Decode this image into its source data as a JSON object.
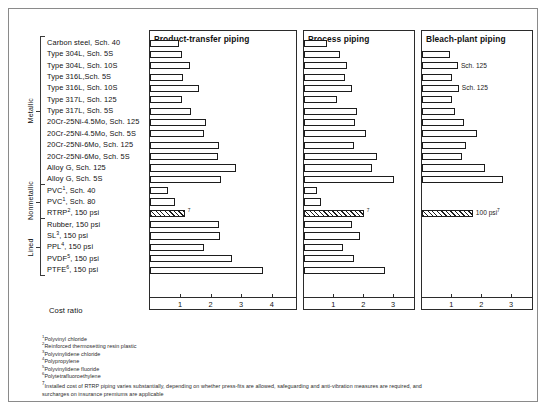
{
  "figure": {
    "cost_ratio_label": "Cost ratio"
  },
  "groups": [
    {
      "label": "Metallic",
      "start": 0,
      "count": 13
    },
    {
      "label": "Nonmetallic",
      "start": 13,
      "count": 3
    },
    {
      "label": "Lined",
      "start": 16,
      "count": 5
    }
  ],
  "rows": [
    {
      "label": "Carbon steel, Sch. 40",
      "sup": ""
    },
    {
      "label": "Type 304L, Sch. 5S",
      "sup": ""
    },
    {
      "label": "Type 304L, Sch. 10S",
      "sup": ""
    },
    {
      "label": "Type 316L,Sch. 5S",
      "sup": ""
    },
    {
      "label": "Type 316L, Sch. 10S",
      "sup": ""
    },
    {
      "label": "Type 317L, Sch. 125",
      "sup": ""
    },
    {
      "label": "Type 317L, Sch. 5S",
      "sup": ""
    },
    {
      "label": "20Cr-25Ni-4.5Mo, Sch. 125",
      "sup": ""
    },
    {
      "label": "20Cr-25Ni-4.5Mo, Sch. 5S",
      "sup": ""
    },
    {
      "label": "20Cr-25Ni-6Mo, Sch. 125",
      "sup": ""
    },
    {
      "label": "20Cr-25Ni-6Mo, Sch. 5S",
      "sup": ""
    },
    {
      "label": "Alloy G, Sch. 125",
      "sup": ""
    },
    {
      "label": "Alloy G, Sch. 5S",
      "sup": ""
    },
    {
      "label": "PVC",
      "sup": "1",
      "suffix": ", Sch. 40"
    },
    {
      "label": "PVC",
      "sup": "1",
      "suffix": ", Sch. 80"
    },
    {
      "label": "RTRP",
      "sup": "2",
      "suffix": ", 150 psi"
    },
    {
      "label": "Rubber, 150 psi",
      "sup": ""
    },
    {
      "label": "SL",
      "sup": "3",
      "suffix": ", 150 psi"
    },
    {
      "label": "PPL",
      "sup": "4",
      "suffix": ", 150 psi"
    },
    {
      "label": "PVDF",
      "sup": "5",
      "suffix": ", 150 psi"
    },
    {
      "label": "PTFE",
      "sup": "6",
      "suffix": ", 150 psi"
    }
  ],
  "chart_data": {
    "type": "bar",
    "xlabel": "Cost ratio",
    "ylabel": "",
    "orientation": "horizontal",
    "grid": false,
    "categories": [
      "Carbon steel, Sch. 40",
      "Type 304L, Sch. 5S",
      "Type 304L, Sch. 10S",
      "Type 316L,Sch. 5S",
      "Type 316L, Sch. 10S",
      "Type 317L, Sch. 125",
      "Type 317L, Sch. 5S",
      "20Cr-25Ni-4.5Mo, Sch. 125",
      "20Cr-25Ni-4.5Mo, Sch. 5S",
      "20Cr-25Ni-6Mo, Sch. 125",
      "20Cr-25Ni-6Mo, Sch. 5S",
      "Alloy G, Sch. 125",
      "Alloy G, Sch. 5S",
      "PVC, Sch. 40",
      "PVC, Sch. 80",
      "RTRP, 150 psi",
      "Rubber, 150 psi",
      "SL, 150 psi",
      "PPL, 150 psi",
      "PVDF, 150 psi",
      "PTFE, 150 psi"
    ],
    "panels": [
      {
        "name": "Product-transfer piping",
        "xlim": [
          0,
          4.45
        ],
        "ticks": [
          1,
          2,
          3,
          4
        ],
        "values": [
          0.98,
          1.05,
          1.32,
          1.08,
          1.62,
          1.05,
          1.35,
          1.85,
          1.78,
          2.28,
          2.25,
          2.82,
          2.35,
          0.62,
          0.82,
          1.15,
          2.28,
          2.3,
          1.78,
          2.7,
          3.72
        ],
        "hatched": [
          15
        ],
        "notes": [
          {
            "row": 15,
            "text": "",
            "sup": "7"
          }
        ]
      },
      {
        "name": "Process piping",
        "xlim": [
          0,
          3.35
        ],
        "ticks": [
          1,
          2,
          3
        ],
        "values": [
          0.8,
          1.22,
          1.45,
          1.38,
          1.62,
          1.12,
          1.78,
          1.72,
          2.08,
          1.68,
          2.45,
          2.3,
          3.02,
          0.45,
          0.6,
          2.02,
          1.62,
          1.88,
          1.32,
          1.7,
          2.72
        ],
        "hatched": [
          15
        ],
        "notes": [
          {
            "row": 15,
            "text": "",
            "sup": "7"
          }
        ]
      },
      {
        "name": "Bleach-plant piping",
        "xlim": [
          0,
          3.35
        ],
        "ticks": [
          1,
          2,
          3
        ],
        "values": [
          null,
          0.95,
          1.22,
          1.02,
          1.25,
          1.02,
          1.12,
          1.42,
          1.85,
          1.5,
          1.35,
          2.12,
          2.72,
          null,
          null,
          1.72,
          null,
          null,
          null,
          null,
          null
        ],
        "hatched": [
          15
        ],
        "notes": [
          {
            "row": 2,
            "text": "Sch. 125",
            "sup": ""
          },
          {
            "row": 4,
            "text": "Sch. 125",
            "sup": ""
          },
          {
            "row": 15,
            "text": "100 psi",
            "sup": "7"
          }
        ]
      }
    ]
  },
  "footnotes": [
    {
      "marker": "1",
      "text": "Polyvinyl chloride"
    },
    {
      "marker": "2",
      "text": "Reinforced thermosetting resin plastic"
    },
    {
      "marker": "3",
      "text": "Polyvinylidene chloride"
    },
    {
      "marker": "4",
      "text": "Polypropylene"
    },
    {
      "marker": "5",
      "text": "Polyvinylidene fluoride"
    },
    {
      "marker": "6",
      "text": "Polytetrafluoroethylene"
    }
  ],
  "footnote_long": {
    "marker": "7",
    "text": "Installed cost of RTRP piping varies substantially, depending on whether press-fits are allowed, safeguarding and anti-vibration measures are required, and surcharges on insurance premiums are applicable"
  }
}
